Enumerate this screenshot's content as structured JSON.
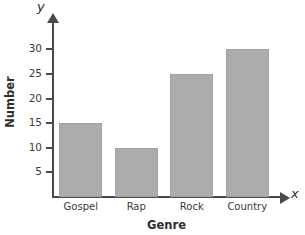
{
  "chart_data": {
    "type": "bar",
    "title": "Favorite Music Genre",
    "xlabel": "Genre",
    "ylabel": "Number",
    "categories": [
      "Gospel",
      "Rap",
      "Rock",
      "Country"
    ],
    "values": [
      15,
      10,
      25,
      30
    ],
    "yticks": [
      5,
      10,
      15,
      20,
      25,
      30
    ],
    "ytick_labels": [
      "5",
      "10",
      "15",
      "20",
      "25",
      "30"
    ],
    "ylim": [
      0,
      33
    ],
    "grid": false,
    "legend": null,
    "axis_letters": {
      "x": "x",
      "y": "y"
    },
    "colors": {
      "bar_fill": "#acacac",
      "bar_stroke": "#a2a2a2",
      "axis": "#4a4a4a",
      "text": "#3a3a3a",
      "background": "#ffffff"
    }
  }
}
